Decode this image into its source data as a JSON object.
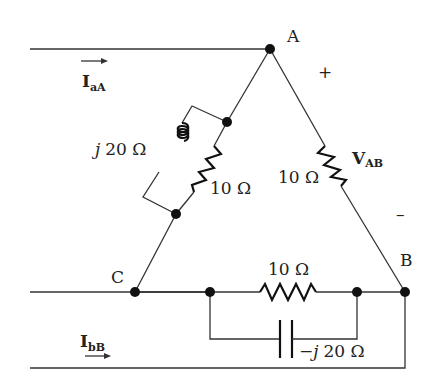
{
  "diagram": {
    "type": "circuit",
    "nodes": {
      "A": {
        "label": "A"
      },
      "B": {
        "label": "B"
      },
      "C": {
        "label": "C"
      }
    },
    "branches": {
      "AB": {
        "resistor_label": "10 Ω",
        "voltage_label": "V",
        "voltage_sub": "AB",
        "plus_sign": "+",
        "minus_sign": "–"
      },
      "CA": {
        "inductor_prefix": "j",
        "inductor_label": "20 Ω",
        "resistor_label": "10 Ω"
      },
      "BC": {
        "resistor_label": "10 Ω",
        "capacitor_prefix": "−j",
        "capacitor_label": "20 Ω"
      }
    },
    "currents": {
      "aA": {
        "main": "I",
        "sub": "aA"
      },
      "bB": {
        "main": "I",
        "sub": "bB"
      }
    }
  }
}
